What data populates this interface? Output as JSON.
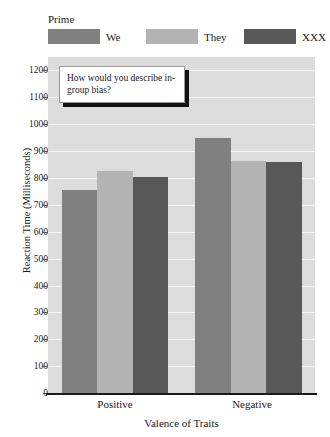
{
  "legend": {
    "title": "Prime",
    "items": [
      {
        "label": "We",
        "color": "#808080"
      },
      {
        "label": "They",
        "color": "#b3b3b3"
      },
      {
        "label": "XXX",
        "color": "#585858"
      }
    ]
  },
  "callout": {
    "text": "How would you describe in-group bias?"
  },
  "chart_data": {
    "type": "bar",
    "title": "",
    "xlabel": "Valence of Traits",
    "ylabel": "Reaction Time (Milliseconds)",
    "categories": [
      "Positive",
      "Negative"
    ],
    "series": [
      {
        "name": "We",
        "color": "#808080",
        "values": [
          755,
          950
        ]
      },
      {
        "name": "They",
        "color": "#b3b3b3",
        "values": [
          825,
          865
        ]
      },
      {
        "name": "XXX",
        "color": "#585858",
        "values": [
          805,
          860
        ]
      }
    ],
    "ylim": [
      0,
      1250
    ],
    "yticks": [
      0,
      100,
      200,
      300,
      400,
      500,
      600,
      700,
      800,
      900,
      1000,
      1100,
      1200
    ],
    "ytick_labels": [
      "0",
      "100",
      "200",
      "300",
      "400",
      "500",
      "600",
      "700",
      "800",
      "900",
      "1000",
      "1100",
      "1200"
    ],
    "grid": true,
    "grid_axis": "y",
    "legend_position": "top",
    "legend_title": "Prime",
    "plot_background": "#dcdcdc",
    "gridline_color": "#f4f4f4",
    "annotations": [
      {
        "text": "How would you describe in-group bias?",
        "style": "callout-box-with-shadow"
      }
    ]
  }
}
